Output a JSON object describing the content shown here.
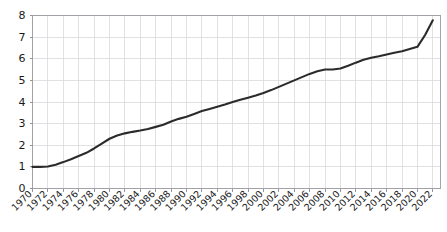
{
  "chart_data": {
    "type": "line",
    "title": "",
    "subtitle": "",
    "xlabel": "",
    "ylabel": "",
    "xlim": [
      1970,
      2023
    ],
    "ylim": [
      0,
      8
    ],
    "grid": true,
    "legend": false,
    "legend_position": "none",
    "line_color": "#2b2b2b",
    "grid_color": "#d9d9dd",
    "frame_color": "#9a9aa0",
    "y_ticks": [
      0,
      1,
      2,
      3,
      4,
      5,
      6,
      7,
      8
    ],
    "y_tick_labels": [
      "0",
      "1",
      "2",
      "3",
      "4",
      "5",
      "6",
      "7",
      "8"
    ],
    "x_ticks": [
      1970,
      1972,
      1974,
      1976,
      1978,
      1980,
      1982,
      1984,
      1986,
      1988,
      1990,
      1992,
      1994,
      1996,
      1998,
      2000,
      2002,
      2004,
      2006,
      2008,
      2010,
      2012,
      2014,
      2016,
      2018,
      2020,
      2022
    ],
    "x_tick_labels": [
      "1970",
      "1972",
      "1974",
      "1976",
      "1978",
      "1980",
      "1982",
      "1984",
      "1986",
      "1988",
      "1990",
      "1992",
      "1994",
      "1996",
      "1998",
      "2000",
      "2002",
      "2004",
      "2006",
      "2008",
      "2010",
      "2012",
      "2014",
      "2016",
      "2018",
      "2020",
      "2022"
    ],
    "series": [
      {
        "name": "value",
        "x": [
          1970,
          1971,
          1972,
          1973,
          1974,
          1975,
          1976,
          1977,
          1978,
          1979,
          1980,
          1981,
          1982,
          1983,
          1984,
          1985,
          1986,
          1987,
          1988,
          1989,
          1990,
          1991,
          1992,
          1993,
          1994,
          1995,
          1996,
          1997,
          1998,
          1999,
          2000,
          2001,
          2002,
          2003,
          2004,
          2005,
          2006,
          2007,
          2008,
          2009,
          2010,
          2011,
          2012,
          2013,
          2014,
          2015,
          2016,
          2017,
          2018,
          2019,
          2020,
          2021,
          2022
        ],
        "values": [
          1.0,
          1.0,
          1.02,
          1.1,
          1.22,
          1.35,
          1.5,
          1.65,
          1.85,
          2.08,
          2.3,
          2.45,
          2.55,
          2.62,
          2.68,
          2.75,
          2.85,
          2.95,
          3.1,
          3.22,
          3.32,
          3.45,
          3.58,
          3.68,
          3.78,
          3.88,
          4.0,
          4.1,
          4.2,
          4.3,
          4.42,
          4.55,
          4.7,
          4.85,
          5.0,
          5.15,
          5.3,
          5.42,
          5.5,
          5.5,
          5.55,
          5.68,
          5.82,
          5.95,
          6.05,
          6.12,
          6.2,
          6.28,
          6.35,
          6.45,
          6.55,
          7.1,
          7.78
        ]
      }
    ]
  }
}
